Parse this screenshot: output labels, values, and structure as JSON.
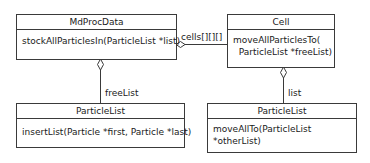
{
  "classes": {
    "mdprocdata": {
      "name": "MdProcData",
      "methods": [
        "stockAllParticlesIn(ParticleList *list)"
      ]
    },
    "cell": {
      "name": "Cell",
      "methods": [
        "moveAllParticlesTo(",
        "  ParticleList *freeList)"
      ]
    },
    "particlelist_left": {
      "name": "ParticleList",
      "methods": [
        "insertList(Particle *first, Particle *last)"
      ]
    },
    "particlelist_right": {
      "name": "ParticleList",
      "methods": [
        "moveAllTo(ParticleList",
        "*otherList)"
      ]
    }
  },
  "associations": {
    "cells": {
      "label": "cells[][][]",
      "from": "MdProcData",
      "to": "Cell",
      "type": "aggregation"
    },
    "freelist": {
      "label": "freeList",
      "from": "MdProcData",
      "to": "ParticleList",
      "type": "aggregation"
    },
    "list": {
      "label": "list",
      "from": "Cell",
      "to": "ParticleList",
      "type": "aggregation"
    }
  },
  "colors": {
    "line": "#3a3a3a",
    "background": "#ffffff",
    "text": "#1a1a1a"
  }
}
